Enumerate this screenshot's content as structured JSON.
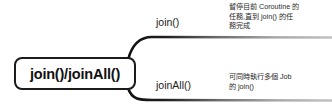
{
  "diagram": {
    "type": "mindmap",
    "root": {
      "label": "join()/joinAll()"
    },
    "branches": [
      {
        "label": "join()",
        "description": "暫停目前 Coroutine 的任務,直到 join() 的任務完成",
        "description_lines": [
          "暫停目前 Coroutine 的",
          "任務,直到 join() 的任",
          "務完成"
        ]
      },
      {
        "label": "joinAll()",
        "description": "可同時執行多個 Job 的 join()",
        "description_lines": [
          "可同時執行多個 Job",
          "的 join()"
        ]
      }
    ],
    "colors": {
      "background": "#ffffff",
      "node_border": "#1b1b1b",
      "node_fill": "#ffffff",
      "node_text": "#111111",
      "branch_label_text": "#1a1a1a",
      "description_text": "#2a2a2a",
      "connector_dark": "#111111",
      "connector_light": "#b9b9b9"
    }
  }
}
